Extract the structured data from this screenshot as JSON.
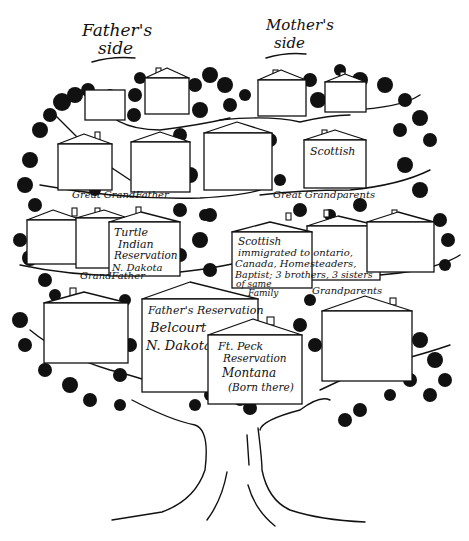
{
  "headers": {
    "fathers_side": [
      "Father's",
      "side"
    ],
    "mothers_side": [
      "Mother's",
      "side"
    ]
  },
  "generation_labels": {
    "great_grandfather": "Great GrandFather",
    "great_grandparents": "Great Grandparents",
    "grandfather": "GrandFather",
    "grandparents": "Grandparents"
  },
  "houses": [
    {
      "id": "gg-top-left",
      "row": 1,
      "lines": []
    },
    {
      "id": "gg-top-center-left",
      "row": 1,
      "lines": []
    },
    {
      "id": "gg-top-center-right",
      "row": 1,
      "lines": []
    },
    {
      "id": "gg-top-right",
      "row": 1,
      "lines": []
    },
    {
      "id": "gg-left-1",
      "row": 2,
      "lines": []
    },
    {
      "id": "gg-left-2",
      "row": 2,
      "lines": [
        "Turtle",
        "Indian",
        "Reservation"
      ]
    },
    {
      "id": "gg-center",
      "row": 2,
      "lines": []
    },
    {
      "id": "gg-right",
      "row": 2,
      "lines": [
        "Scottish"
      ]
    },
    {
      "id": "g-left-1",
      "row": 3,
      "lines": []
    },
    {
      "id": "g-left-2",
      "row": 3,
      "lines": []
    },
    {
      "id": "g-left-3",
      "row": 3,
      "lines": [
        "Turtle",
        "Indian",
        "Reservation",
        "N. Dakota"
      ]
    },
    {
      "id": "g-right-1",
      "row": 3,
      "lines": [
        "Scottish",
        "immigrated to ontario,",
        "Canada, Homesteaders,",
        "Baptist; 3 brothers, 3 sisters",
        "of same",
        "Family"
      ]
    },
    {
      "id": "g-right-2",
      "row": 3,
      "lines": []
    },
    {
      "id": "g-right-3",
      "row": 3,
      "lines": []
    },
    {
      "id": "p-left",
      "row": 4,
      "lines": []
    },
    {
      "id": "p-father",
      "row": 4,
      "lines": [
        "Father's Reservation",
        "Belcourt",
        "N. Dakota"
      ]
    },
    {
      "id": "p-mother",
      "row": 4,
      "lines": [
        "Ft. Peck",
        "Reservation",
        "Montana",
        "(Born there)"
      ]
    },
    {
      "id": "p-right",
      "row": 4,
      "lines": []
    }
  ],
  "colors": {
    "ink": "#111111",
    "paper": "#ffffff"
  }
}
